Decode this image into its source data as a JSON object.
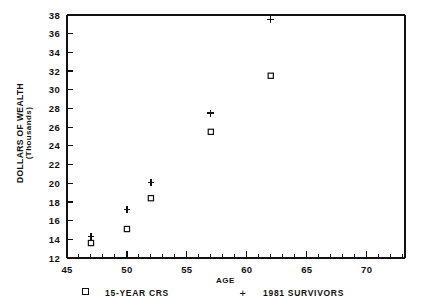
{
  "chart_data": {
    "type": "scatter",
    "title": "",
    "xlabel": "AGE",
    "ylabel": "DOLLARS OF WEALTH",
    "ylabel_sub": "(Thousands)",
    "xlim": [
      45,
      73.2
    ],
    "ylim": [
      12,
      38
    ],
    "x_ticks": [
      45,
      50,
      55,
      60,
      65,
      70
    ],
    "x_tick_labels": [
      "45",
      "50",
      "55",
      "60",
      "65",
      "70"
    ],
    "x_minor_step": 1,
    "y_ticks": [
      12,
      14,
      16,
      18,
      20,
      22,
      24,
      26,
      28,
      30,
      32,
      34,
      36,
      38
    ],
    "y_tick_labels": [
      "12",
      "14",
      "16",
      "18",
      "20",
      "22",
      "24",
      "26",
      "28",
      "30",
      "32",
      "34",
      "36",
      "38"
    ],
    "grid": false,
    "legend_position": "below",
    "series": [
      {
        "name": "15-YEAR CRS",
        "marker": "square",
        "x": [
          47,
          50,
          52,
          57,
          62
        ],
        "y": [
          13.6,
          15.1,
          18.4,
          25.5,
          31.5
        ]
      },
      {
        "name": "1981 SURVIVORS",
        "marker": "plus",
        "x": [
          47,
          50,
          52,
          57,
          62
        ],
        "y": [
          14.3,
          17.2,
          20.1,
          27.5,
          37.5
        ]
      }
    ]
  },
  "legend": {
    "crs_marker": "square-marker-icon",
    "crs_label": "15-YEAR CRS",
    "survivors_marker": "plus-marker-icon",
    "survivors_label": "1981 SURVIVORS"
  },
  "axes": {
    "x_title": "AGE",
    "y_title": "DOLLARS OF WEALTH",
    "y_subtitle": "(Thousands)"
  },
  "style": {
    "ink": "#111111",
    "paper": "#ffffff"
  }
}
